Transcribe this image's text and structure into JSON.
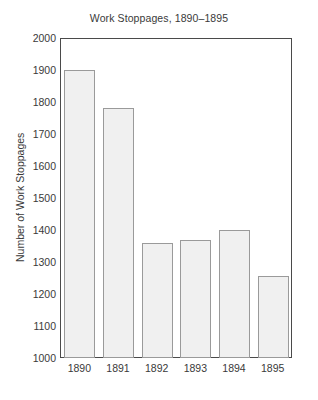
{
  "chart_data": {
    "type": "bar",
    "title": "Work Stoppages, 1890–1895",
    "xlabel": "",
    "ylabel": "Number of Work Stoppages",
    "categories": [
      "1890",
      "1891",
      "1892",
      "1893",
      "1894",
      "1895"
    ],
    "values": [
      1900,
      1780,
      1360,
      1370,
      1400,
      1255
    ],
    "ylim": [
      1000,
      2000
    ],
    "ytick_values": [
      1000,
      1100,
      1200,
      1300,
      1400,
      1500,
      1600,
      1700,
      1800,
      1900,
      2000
    ],
    "ytick_labels": [
      "1000",
      "1100",
      "1200",
      "1300",
      "1400",
      "1500",
      "1600",
      "1700",
      "1800",
      "1900",
      "2000"
    ],
    "grid": false,
    "legend": false,
    "bar_fill_color": "#f0f0f0",
    "bar_edge_color": "#9a9a9a",
    "axis_color": "#4a4a4a",
    "background_color": "#ffffff",
    "text_color": "#3a3a3a"
  }
}
